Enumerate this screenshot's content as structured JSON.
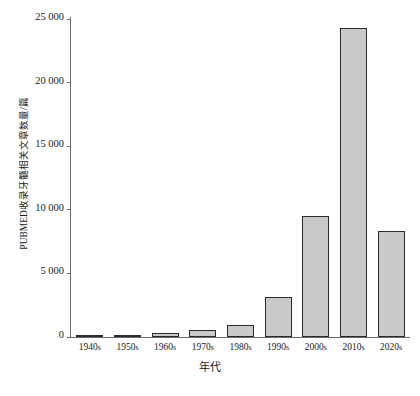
{
  "chart_data": {
    "type": "bar",
    "title": "",
    "xlabel": "年代",
    "ylabel": "PUBMED收录牙髓相关文章数量/篇",
    "categories": [
      "1940s",
      "1950s",
      "1960s",
      "1970s",
      "1980s",
      "1990s",
      "2000s",
      "2010s",
      "2020s"
    ],
    "values": [
      100,
      150,
      350,
      550,
      950,
      3150,
      9500,
      24300,
      8300
    ],
    "ylim": [
      0,
      25000
    ],
    "ytick_values": [
      0,
      5000,
      10000,
      15000,
      20000,
      25000
    ],
    "ytick_labels": [
      "0",
      "5 000",
      "10 000",
      "15 000",
      "20 000",
      "25 000"
    ],
    "grid": false,
    "legend": "none",
    "bar_fill_color": "#c9c9c9",
    "bar_edge_color": "#2b2b2b",
    "axis_color": "#6b6b6b"
  }
}
